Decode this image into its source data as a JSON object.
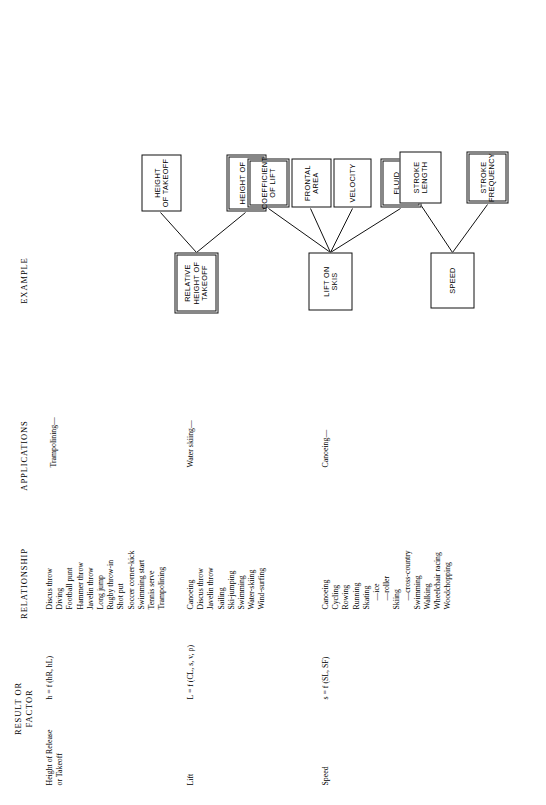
{
  "headings": {
    "example": "EXAMPLE",
    "applications": "APPLICATIONS",
    "relationship": "RELATIONSHIP",
    "result_or_factor": "RESULT OR\nFACTOR"
  },
  "colors": {
    "ink": "#111111",
    "paper": "#ffffff"
  },
  "groups": [
    {
      "row_label": "Height of Release\n   or Takeoff",
      "formula": "h = f (h",
      "formula_sub1": "R",
      "formula_mid": ", h",
      "formula_sub2": "L",
      "formula_end": ")",
      "formula_plain": "h = f (hR, hL)",
      "application": "Trampolining—",
      "relationship_items": [
        "Discus throw",
        "Diving",
        "Football punt",
        "Hammer throw",
        "Javelin throw",
        "Long jump",
        "Rugby throw-in",
        "Shot put",
        "Soccer corner-kick",
        "Swimming start",
        "Tennis serve",
        "Trampolining"
      ],
      "root_box": "RELATIVE\nHEIGHT OF\nTAKEOFF",
      "child_boxes": [
        "HEIGHT\nOF TAKEOFF",
        "HEIGHT OF\nLANDING"
      ]
    },
    {
      "row_label": "Lift",
      "formula_plain": "L = f (CL, s, v, ρ)",
      "application": "Water skiing—",
      "relationship_items": [
        "Canoeing",
        "Discus throw",
        "Javelin throw",
        "Sailing",
        "Ski-jumping",
        "Swimming",
        "Water-skiing",
        "Wind-surfing"
      ],
      "root_box": "LIFT ON\nSKIS",
      "child_boxes": [
        "COEFFICIENT\nOF LIFT",
        "FRONTAL\nAREA",
        "VELOCITY",
        "FLUID\nDENSITY"
      ]
    },
    {
      "row_label": "Speed",
      "formula_plain": "s = f (SL, SF)",
      "application": "Canoeing—",
      "relationship_items": [
        "Canoeing",
        "Cycling",
        "Rowing",
        "Running",
        "Skating",
        "—ice",
        "—roller",
        "Skiing",
        "—cross-country",
        "Swimming",
        "Walking",
        "Wheelchair racing",
        "Woodchopping"
      ],
      "relationship_sub_flags": [
        false,
        false,
        false,
        false,
        false,
        true,
        true,
        false,
        true,
        false,
        false,
        false,
        false
      ],
      "root_box": "SPEED",
      "child_boxes": [
        "STROKE\nLENGTH",
        "STROKE\nFREQUENCY"
      ]
    }
  ]
}
